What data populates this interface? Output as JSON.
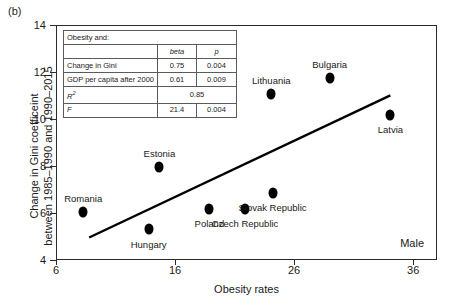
{
  "panel": {
    "label": "(b)"
  },
  "annotation": {
    "sex": "Male"
  },
  "axes": {
    "y_title_line1": "Change in Gini coefficeint",
    "y_title_line2": "between 1985–1990 and 1990–2015",
    "x_title": "Obesity rates",
    "y_ticks": [
      "4",
      "6",
      "8",
      "10",
      "12",
      "14"
    ],
    "x_ticks": [
      "6",
      "16",
      "26",
      "36"
    ]
  },
  "stats_table": {
    "title": "Obesity and:",
    "col_headers": [
      "beta",
      "p"
    ],
    "rows": [
      {
        "label": "Change in Gini",
        "beta": "0.75",
        "p": "0.004"
      },
      {
        "label": "GDP per capita after 2000",
        "beta": "0.61",
        "p": "0.009"
      }
    ],
    "r2_label": "R",
    "r2_sup": "2",
    "r2_value": "0.85",
    "f_label": "F",
    "f_value": "21.4",
    "f_p": "0.004"
  },
  "chart_data": {
    "type": "scatter",
    "title": "",
    "xlabel": "Obesity rates",
    "ylabel": "Change in Gini coefficeint between 1985–1990 and 1990–2015",
    "xlim": [
      6,
      38
    ],
    "ylim": [
      4,
      14
    ],
    "xticks": [
      6,
      16,
      26,
      36
    ],
    "yticks": [
      4,
      6,
      8,
      10,
      12,
      14
    ],
    "grid": false,
    "legend": null,
    "annotations": [
      "Male",
      "(b)"
    ],
    "points": [
      {
        "label": "Romania",
        "x": 8.2,
        "y": 6.1,
        "label_dx": 0,
        "label_dy": -14
      },
      {
        "label": "Hungary",
        "x": 13.7,
        "y": 5.35,
        "label_dx": 0,
        "label_dy": 15
      },
      {
        "label": "Estonia",
        "x": 14.6,
        "y": 8.0,
        "label_dx": 0,
        "label_dy": -14
      },
      {
        "label": "Poland",
        "x": 18.8,
        "y": 6.2,
        "label_dx": 0,
        "label_dy": 14
      },
      {
        "label": "Czech Republic",
        "x": 21.8,
        "y": 6.2,
        "label_dx": 0,
        "label_dy": 14
      },
      {
        "label": "Slovak Republic",
        "x": 24.1,
        "y": 6.9,
        "label_dx": 0,
        "label_dy": 14
      },
      {
        "label": "Lithuania",
        "x": 24.0,
        "y": 11.1,
        "label_dx": 0,
        "label_dy": -14
      },
      {
        "label": "Bulgaria",
        "x": 28.9,
        "y": 11.8,
        "label_dx": 0,
        "label_dy": -14
      },
      {
        "label": "Latvia",
        "x": 34.0,
        "y": 10.2,
        "label_dx": 0,
        "label_dy": 14
      }
    ],
    "fit_line": {
      "x1": 8.7,
      "y1": 5.0,
      "x2": 34.0,
      "y2": 11.05
    }
  }
}
